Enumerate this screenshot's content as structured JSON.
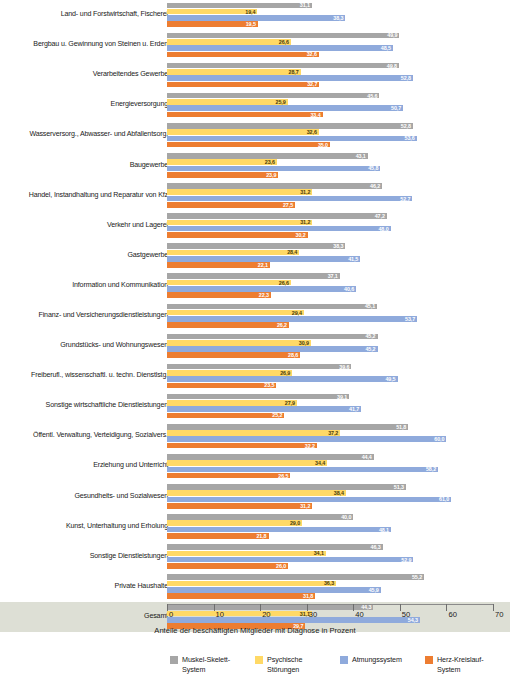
{
  "chart_data": {
    "type": "bar",
    "orientation": "horizontal",
    "grouped": true,
    "title": "",
    "xlabel": "Anteile der beschäftigten Mitglieder mit Diagnose in Prozent",
    "ylabel": "",
    "xlim": [
      0,
      70
    ],
    "xticks": [
      0,
      10,
      20,
      30,
      40,
      50,
      60,
      70
    ],
    "grid": false,
    "legend_position": "bottom",
    "series": [
      {
        "name": "Muskel-Skelett-System",
        "color": "#a6a6a6",
        "values": [
          31.1,
          49.9,
          49.8,
          45.6,
          52.8,
          43.1,
          46.2,
          47.2,
          38.3,
          37.1,
          45.1,
          45.2,
          39.6,
          39.1,
          51.8,
          44.4,
          51.3,
          40.0,
          46.3,
          55.2,
          44.3
        ]
      },
      {
        "name": "Psychische Störungen",
        "color": "#ffd966",
        "values": [
          19.4,
          26.6,
          28.7,
          25.9,
          32.6,
          23.6,
          31.2,
          31.2,
          28.4,
          26.6,
          29.4,
          30.9,
          26.9,
          27.9,
          37.2,
          34.4,
          38.4,
          29.0,
          34.1,
          36.3,
          31.1
        ]
      },
      {
        "name": "Atmungssystem",
        "color": "#8faadc",
        "values": [
          38.3,
          48.5,
          52.8,
          50.7,
          53.6,
          45.8,
          52.7,
          48.0,
          41.5,
          40.6,
          53.7,
          45.2,
          49.5,
          41.7,
          60.0,
          58.2,
          61.0,
          48.1,
          52.9,
          45.9,
          54.3
        ]
      },
      {
        "name": "Herz-Kreislauf-System",
        "color": "#ed7d31",
        "values": [
          19.5,
          32.6,
          32.7,
          33.4,
          35.0,
          23.9,
          27.5,
          30.2,
          22.1,
          22.3,
          26.2,
          28.6,
          23.5,
          25.2,
          32.2,
          26.5,
          31.2,
          21.8,
          26.0,
          31.8,
          29.7
        ]
      }
    ],
    "categories": [
      "Land- und Forstwirtschaft, Fischerei",
      "Bergbau u. Gewinnung von Steinen u. Erden",
      "Verarbeitendes Gewerbe",
      "Energieversorgung",
      "Wasserversorg., Abwasser- und Abfallentsorg.",
      "Baugewerbe",
      "Handel, Instandhaltung und Reparatur von Kfz",
      "Verkehr und Lagerei",
      "Gastgewerbe",
      "Information und Kommunikation",
      "Finanz- und Versicherungsdienstleistungen",
      "Grundstücks- und Wohnungswesen",
      "Freiberufl., wissenschaftl. u. techn. Dienstlstg.",
      "Sonstige wirtschaftliche Dienstleistungen",
      "Öffentl. Verwaltung, Verteidigung, Sozialvers.",
      "Erziehung und Unterricht",
      "Gesundheits- und Sozialwesen",
      "Kunst, Unterhaltung und Erholung",
      "Sonstige Dienstleistungen",
      "Private Haushalte",
      "Gesamt"
    ],
    "highlight_category": "Gesamt",
    "value_label_format": "comma-decimal"
  },
  "legend": {
    "items": [
      {
        "label_line1": "Muskel-Skelett-",
        "label_line2": "System",
        "color": "#a6a6a6"
      },
      {
        "label_line1": "Psychische",
        "label_line2": "Störungen",
        "color": "#ffd966"
      },
      {
        "label_line1": "Atmungssystem",
        "label_line2": "",
        "color": "#8faadc"
      },
      {
        "label_line1": "Herz-Kreislauf-",
        "label_line2": "System",
        "color": "#ed7d31"
      }
    ]
  },
  "axis": {
    "title": "Anteile der beschäftigten Mitglieder mit Diagnose in Prozent",
    "ticks": [
      "0",
      "10",
      "20",
      "30",
      "40",
      "50",
      "60",
      "70"
    ]
  }
}
